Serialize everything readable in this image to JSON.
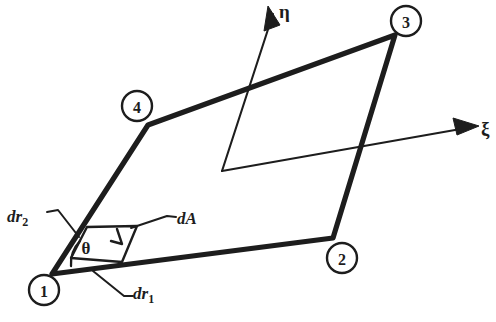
{
  "figure": {
    "kind": "geometry-diagram",
    "background_color": "#ffffff",
    "ink_color": "#1d1d1d",
    "width": 496,
    "height": 322
  },
  "element": {
    "shape": "quadrilateral",
    "edge_stroke_width": 5.2,
    "vertices": [
      {
        "id": "1",
        "label": "1",
        "x": 52,
        "y": 274,
        "circle_x": 44,
        "circle_y": 290,
        "circle_r": 15
      },
      {
        "id": "2",
        "label": "2",
        "x": 333,
        "y": 238,
        "circle_x": 342,
        "circle_y": 258,
        "circle_r": 15
      },
      {
        "id": "3",
        "label": "3",
        "x": 395,
        "y": 35,
        "circle_x": 406,
        "circle_y": 21,
        "circle_r": 15
      },
      {
        "id": "4",
        "label": "4",
        "x": 148,
        "y": 125,
        "circle_x": 137,
        "circle_y": 106,
        "circle_r": 15
      }
    ],
    "edge_path": "M 52 274 L 333 238 L 395 35 L 148 125 Z"
  },
  "axes": {
    "origin": {
      "x": 222,
      "y": 171
    },
    "eta": {
      "name": "eta-axis",
      "label": "η",
      "label_x": 279,
      "label_y": 16,
      "line": {
        "x1": 222,
        "y1": 171,
        "x2": 273,
        "y2": 14
      },
      "arrow_head": "268,6 265,30 279,24"
    },
    "xi": {
      "name": "xi-axis",
      "label": "ξ",
      "label_x": 481,
      "label_y": 134,
      "line": {
        "x1": 222,
        "y1": 171,
        "x2": 475,
        "y2": 127
      },
      "arrow_head": "478,126 454,119 457,134"
    }
  },
  "annotations": {
    "theta": {
      "label": "θ",
      "x": 85,
      "y": 247,
      "arc_path": "M 79 240 A 30 30 0 0 0 73 265"
    },
    "dr1": {
      "label": "dr",
      "subscript": "1",
      "label_x": 133,
      "label_y": 297,
      "leader_path": "M 93 271 L 124 296 L 132 296"
    },
    "dr2": {
      "label": "dr",
      "subscript": "2",
      "label_x": 8,
      "label_y": 221,
      "leader_path": "M 46 212 L 57 210 L 78 236"
    },
    "dA": {
      "label": "dA",
      "label_x": 177,
      "label_y": 225,
      "leader_path": "M 132 227 L 166 217 L 175 218",
      "parallelogram_path": "M 87 227 L 137 226 L 122 262 L 71 258 Z",
      "inner_tick_path": "M 118 228 L 122 243 L 112 241"
    }
  }
}
